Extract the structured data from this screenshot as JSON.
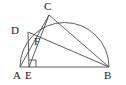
{
  "figure": {
    "background_color": "#ffffff",
    "stroke_color": "#4a4a4a",
    "label_color": "#1a1a1a",
    "canvas": {
      "width": 126,
      "height": 85
    }
  },
  "points": [
    {
      "name": "A",
      "label": "A",
      "x": 20,
      "y": 67,
      "label_x": 13,
      "label_y": 70
    },
    {
      "name": "B",
      "label": "B",
      "x": 109,
      "y": 67,
      "label_x": 104,
      "label_y": 70
    },
    {
      "name": "C",
      "label": "C",
      "x": 49,
      "y": 15,
      "label_x": 44,
      "label_y": 1
    },
    {
      "name": "D",
      "label": "D",
      "x": 28,
      "y": 32,
      "label_x": 11,
      "label_y": 25
    },
    {
      "name": "E",
      "label": "E",
      "x": 29,
      "y": 67,
      "label_x": 25,
      "label_y": 70
    },
    {
      "name": "F",
      "label": "F",
      "x": 37,
      "y": 43,
      "label_x": 34,
      "label_y": 36
    }
  ],
  "segments": [
    {
      "name": "diameter-AB",
      "from": "A",
      "to": "B"
    },
    {
      "name": "chord-AC",
      "from": "A",
      "to": "C"
    },
    {
      "name": "chord-CB",
      "from": "C",
      "to": "B"
    },
    {
      "name": "chord-DB",
      "from": "D",
      "to": "B"
    },
    {
      "name": "altitude-DE",
      "from": "D",
      "to": "E"
    },
    {
      "name": "segment-CE",
      "from": "C",
      "to": "E"
    }
  ],
  "arc": {
    "name": "semicircle-arc",
    "center_x": 64.5,
    "center_y": 67,
    "radius": 44.5,
    "start_x": 20,
    "start_y": 67,
    "end_x": 109,
    "end_y": 67
  },
  "right_angle": {
    "name": "right-angle-marker-at-E",
    "vertex_x": 29,
    "vertex_y": 67,
    "size": 7
  }
}
